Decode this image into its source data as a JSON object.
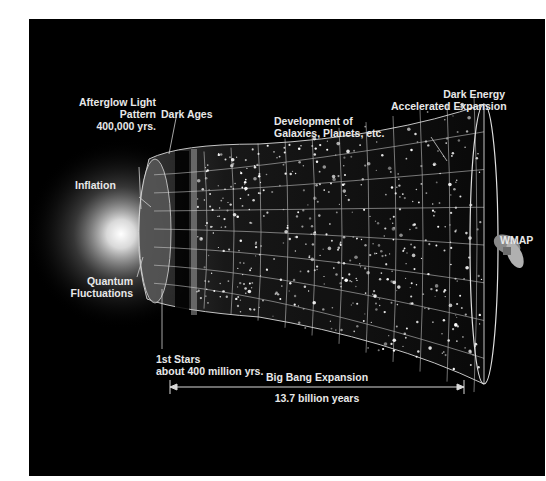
{
  "diagram": {
    "colors": {
      "background": "#000000",
      "label": "#e8e8e8",
      "grid": "#d8d8d8"
    },
    "labels": {
      "afterglow": [
        "Afterglow Light",
        "Pattern",
        "400,000 yrs."
      ],
      "dark_ages": "Dark Ages",
      "development": [
        "Development of",
        "Galaxies, Planets, etc."
      ],
      "dark_energy": [
        "Dark Energy",
        "Accelerated Expansion"
      ],
      "inflation": "Inflation",
      "quantum": [
        "Quantum",
        "Fluctuations"
      ],
      "first_stars": [
        "1st Stars",
        "about 400 million yrs."
      ],
      "wmap": "WMAP",
      "expansion": "Big Bang Expansion",
      "duration": "13.7 billion years"
    }
  }
}
